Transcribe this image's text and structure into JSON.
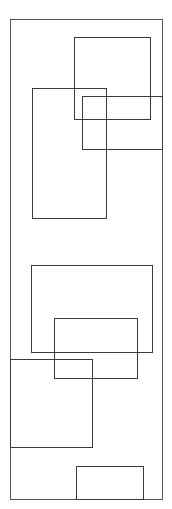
{
  "canvas": {
    "width": 172,
    "height": 509,
    "background": "#ffffff"
  },
  "stroke_color": "#3a3a3a",
  "rectangles": [
    {
      "id": "outer-frame",
      "x": 10,
      "y": 19,
      "w": 153,
      "h": 481
    },
    {
      "id": "rect-a",
      "x": 74,
      "y": 37,
      "w": 77,
      "h": 83
    },
    {
      "id": "rect-b",
      "x": 32,
      "y": 88,
      "w": 75,
      "h": 131
    },
    {
      "id": "rect-c",
      "x": 82,
      "y": 96,
      "w": 81,
      "h": 54
    },
    {
      "id": "rect-d",
      "x": 31,
      "y": 265,
      "w": 122,
      "h": 88
    },
    {
      "id": "rect-e",
      "x": 54,
      "y": 318,
      "w": 84,
      "h": 61
    },
    {
      "id": "rect-f",
      "x": 10,
      "y": 359,
      "w": 83,
      "h": 89
    },
    {
      "id": "rect-g",
      "x": 76,
      "y": 466,
      "w": 68,
      "h": 34
    }
  ]
}
